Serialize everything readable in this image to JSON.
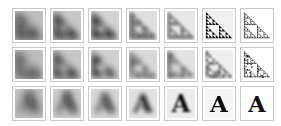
{
  "rows": [
    {
      "name": "sierpinski-smooth",
      "subject": "sierpinski-triangle",
      "stages": [
        {
          "sharpness": 0.0,
          "noise": 0.6
        },
        {
          "sharpness": 0.15,
          "noise": 0.4
        },
        {
          "sharpness": 0.35,
          "noise": 0.5
        },
        {
          "sharpness": 0.55,
          "noise": 0.3
        },
        {
          "sharpness": 0.7,
          "noise": 0.25
        },
        {
          "sharpness": 0.85,
          "noise": 0.2
        },
        {
          "sharpness": 1.0,
          "noise": 0.0
        }
      ]
    },
    {
      "name": "sierpinski-noisy",
      "subject": "noisy-triangle",
      "stages": [
        {
          "sharpness": 0.0,
          "noise": 0.3
        },
        {
          "sharpness": 0.15,
          "noise": 0.4
        },
        {
          "sharpness": 0.3,
          "noise": 0.5
        },
        {
          "sharpness": 0.45,
          "noise": 0.6
        },
        {
          "sharpness": 0.6,
          "noise": 0.7
        },
        {
          "sharpness": 0.8,
          "noise": 0.8
        },
        {
          "sharpness": 1.0,
          "noise": 0.9
        }
      ]
    },
    {
      "name": "letter-a",
      "subject": "letter",
      "glyph": "A",
      "stages": [
        {
          "sharpness": 0.0,
          "noise": 0.2
        },
        {
          "sharpness": 0.15,
          "noise": 0.2
        },
        {
          "sharpness": 0.35,
          "noise": 0.2
        },
        {
          "sharpness": 0.55,
          "noise": 0.15
        },
        {
          "sharpness": 0.75,
          "noise": 0.1
        },
        {
          "sharpness": 0.9,
          "noise": 0.05
        },
        {
          "sharpness": 1.0,
          "noise": 0.0
        }
      ]
    }
  ],
  "colors": {
    "ink": "#111111",
    "paper": "#ffffff",
    "border": "#c8c8c8"
  }
}
